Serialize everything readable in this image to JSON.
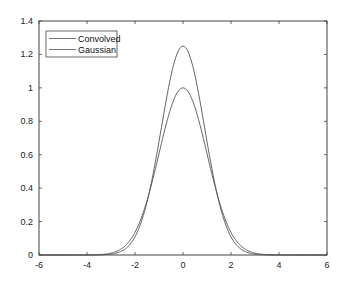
{
  "chart_data": {
    "type": "line",
    "title": "",
    "xlabel": "",
    "ylabel": "",
    "xlim": [
      -6,
      6
    ],
    "ylim": [
      0,
      1.4
    ],
    "xticks": [
      -6,
      -4,
      -2,
      0,
      2,
      4,
      6
    ],
    "yticks": [
      0,
      0.2,
      0.4,
      0.6,
      0.8,
      1,
      1.2,
      1.4
    ],
    "xtick_labels": [
      "-6",
      "-4",
      "-2",
      "0",
      "2",
      "4",
      "6"
    ],
    "ytick_labels": [
      "0",
      "0.2",
      "0.4",
      "0.6",
      "0.8",
      "1",
      "1.2",
      "1.4"
    ],
    "grid": false,
    "legend_position": "upper left",
    "x": [
      -4,
      -3.5,
      -3,
      -2.5,
      -2,
      -1.5,
      -1,
      -0.5,
      0,
      0.5,
      1,
      1.5,
      2,
      2.5,
      3,
      3.5,
      4
    ],
    "series": [
      {
        "name": "Convolved",
        "color": "#555555",
        "values": [
          0.0,
          0.003,
          0.016,
          0.07,
          0.2,
          0.44,
          0.78,
          1.1,
          1.25,
          1.1,
          0.78,
          0.44,
          0.2,
          0.07,
          0.016,
          0.003,
          0.0
        ]
      },
      {
        "name": "Gaussian",
        "color": "#555555",
        "values": [
          0.0003,
          0.002,
          0.011,
          0.044,
          0.135,
          0.325,
          0.607,
          0.882,
          1.0,
          0.882,
          0.607,
          0.325,
          0.135,
          0.044,
          0.011,
          0.002,
          0.0003
        ]
      }
    ]
  },
  "legend": {
    "items": [
      {
        "label": "Convolved"
      },
      {
        "label": "Gaussian"
      }
    ]
  }
}
